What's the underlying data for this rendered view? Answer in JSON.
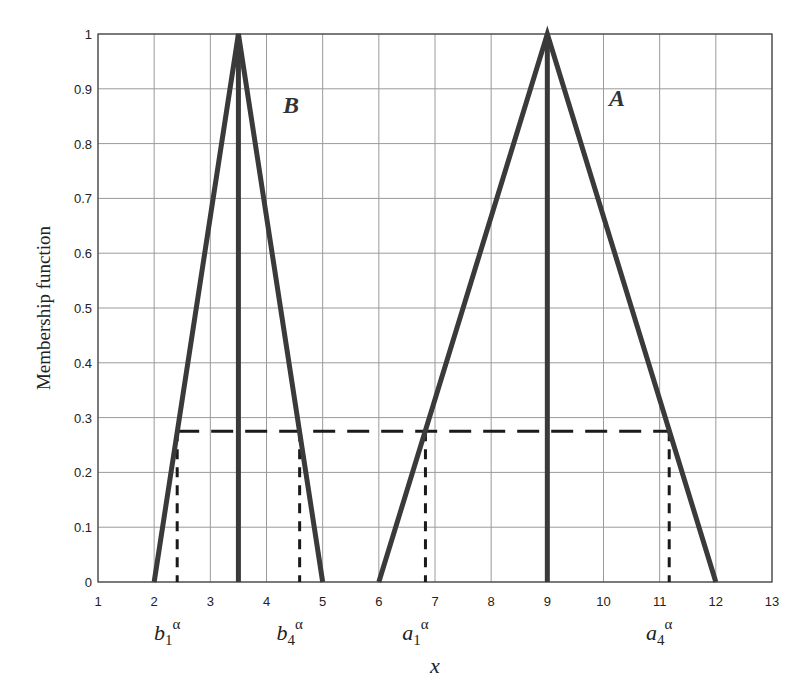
{
  "chart_data": {
    "type": "line",
    "title": "",
    "xlabel": "x",
    "ylabel": "Membership function",
    "xlim": [
      1,
      13
    ],
    "ylim": [
      0,
      1
    ],
    "grid": true,
    "xticks": [
      1,
      2,
      3,
      4,
      5,
      6,
      7,
      8,
      9,
      10,
      11,
      12,
      13
    ],
    "yticks": [
      0,
      0.1,
      0.2,
      0.3,
      0.4,
      0.5,
      0.6,
      0.7,
      0.8,
      0.9,
      1
    ],
    "ytick_labels": [
      "0",
      "0.1",
      "0.2",
      "0.3",
      "0.4",
      "0.5",
      "0.6",
      "0.7",
      "0.8",
      "0.9",
      "1"
    ],
    "series": [
      {
        "name": "B",
        "x": [
          2,
          3.5,
          5
        ],
        "y": [
          0,
          1,
          0
        ],
        "center_line_x": 3.5,
        "label_pos": [
          4.4,
          0.9
        ]
      },
      {
        "name": "A",
        "x": [
          6,
          9,
          12
        ],
        "y": [
          0,
          1,
          0
        ],
        "center_line_x": 9,
        "label_pos": [
          10.4,
          0.9
        ]
      }
    ],
    "alpha_cut": {
      "alpha": 0.275,
      "style": "dashed",
      "x_from": 2.41,
      "x_to": 11.17,
      "drop_lines": [
        {
          "label": "b",
          "sub": "1",
          "sup": "α",
          "x": 2.41
        },
        {
          "label": "b",
          "sub": "4",
          "sup": "α",
          "x": 4.59
        },
        {
          "label": "a",
          "sub": "1",
          "sup": "α",
          "x": 6.83
        },
        {
          "label": "a",
          "sub": "4",
          "sup": "α",
          "x": 11.17
        }
      ]
    },
    "colors": {
      "triangle": "#3a3a3a",
      "grid": "#9a9a9a",
      "dash": "#1a1a1a",
      "axis": "#444444"
    }
  },
  "labels": {
    "ylabel": "Membership function",
    "xlabel": "x",
    "set_B": "B",
    "set_A": "A"
  }
}
